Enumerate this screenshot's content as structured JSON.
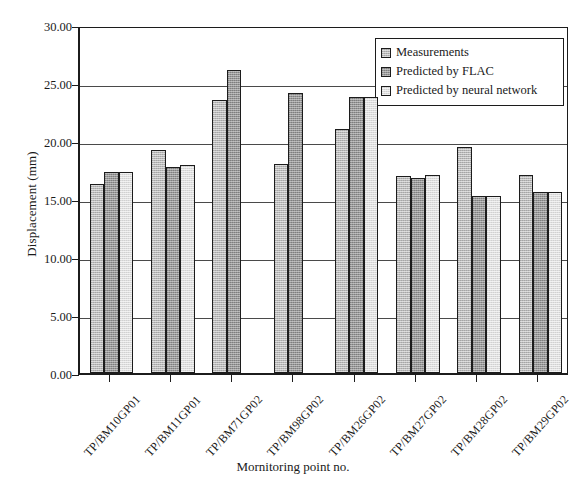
{
  "chart_data": {
    "type": "bar",
    "title": "",
    "xlabel": "Mornitoring point no.",
    "ylabel": "Displacement (mm)",
    "ylim": [
      0,
      30
    ],
    "ytick_step": 5,
    "ytick_labels": [
      "0.00",
      "5.00",
      "10.00",
      "15.00",
      "20.00",
      "25.00",
      "30.00"
    ],
    "ytick_values": [
      0,
      5,
      10,
      15,
      20,
      25,
      30
    ],
    "grid": "horizontal",
    "legend_position": "top-right",
    "categories": [
      "TP/BM10GP01",
      "TP/BM11GP01",
      "TP/BM71GP02",
      "TP/BM98GP02",
      "TP/BM26GP02",
      "TP/BM27GP02",
      "TP/BM28GP02",
      "TP/BM29GP02"
    ],
    "series": [
      {
        "name": "Measurements",
        "color": "#b8b8b8",
        "values": [
          16.3,
          19.2,
          23.5,
          18.0,
          21.0,
          17.0,
          19.5,
          17.1
        ]
      },
      {
        "name": "Predicted by FLAC",
        "color": "#979797",
        "values": [
          17.3,
          17.8,
          26.1,
          24.1,
          23.8,
          16.8,
          15.3,
          15.6
        ]
      },
      {
        "name": "Predicted by neural network",
        "color": "#dedede",
        "values": [
          17.3,
          17.9,
          null,
          null,
          23.8,
          17.1,
          15.3,
          15.6
        ]
      }
    ]
  },
  "legend": {
    "items": [
      {
        "label": "Measurements"
      },
      {
        "label": "Predicted by FLAC"
      },
      {
        "label": "Predicted by neural network"
      }
    ]
  }
}
